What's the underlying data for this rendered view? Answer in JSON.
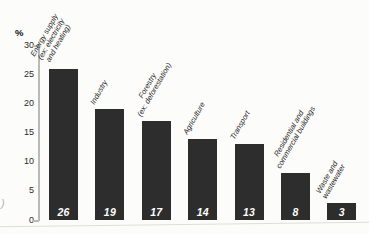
{
  "chart_data": {
    "type": "bar",
    "title": "",
    "unit_label": "%",
    "xlabel": "",
    "ylabel": "%",
    "ylim": [
      0,
      30
    ],
    "yticks": [
      30,
      25,
      20,
      15,
      10,
      5,
      0
    ],
    "categories": [
      "Energy supply (ex: electricity and heating)",
      "Industry",
      "Forestry (ex: deforestation)",
      "Agriculture",
      "Transport",
      "Residential and commercial buildings",
      "Waste and wastewater"
    ],
    "category_label_lines": [
      "Energy supply\n(ex: electricity\nand heating)",
      "Industry",
      "Forestry\n(ex: deforestation)",
      "Agriculture",
      "Transport",
      "Residential and\ncommercial buildings",
      "Waste and\nwastewater"
    ],
    "values": [
      26,
      19,
      17,
      14,
      13,
      8,
      3
    ],
    "value_labels": [
      "26",
      "19",
      "17",
      "14",
      "13",
      "8",
      "3"
    ],
    "grid": false,
    "legend": null,
    "colors": {
      "bar": "#2d2d2d",
      "value_label": "#ffffff",
      "axis": "#b9b9b6",
      "label_text": "#1e1e1e",
      "background": "#fcfcfa"
    }
  },
  "artifacts": {
    "stray_left_edge_mark": ")"
  }
}
